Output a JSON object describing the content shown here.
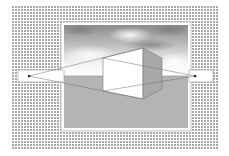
{
  "diagram": {
    "elements": {
      "background": "dotted-halftone",
      "picture_frame": "photo-frame",
      "sky": "cloudy-sky",
      "ground": "gray-ground-plane",
      "horizon_line": "horizon",
      "cube": "cube",
      "vanishing_points": [
        "left-vanishing-point",
        "right-vanishing-point"
      ]
    },
    "colors": {
      "background_dots": "#9a9a9a",
      "frame_border": "#ffffff",
      "frame_outline": "#b5b5b5",
      "sky_dark": "#8c8c8c",
      "sky_light": "#ffffff",
      "ground": "#b4b4b4",
      "cube_front": "#ffffff",
      "cube_side": "#a8a8a8",
      "lines": "#6e6e6e",
      "vp_box": "#ffffff",
      "vp_dot": "#222222"
    }
  }
}
